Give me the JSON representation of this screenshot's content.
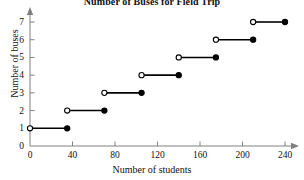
{
  "chart_data": {
    "type": "line",
    "title": "Number of Buses for Field Trip",
    "xlabel": "Number of students",
    "ylabel": "Number of buses",
    "xlim": [
      0,
      240
    ],
    "ylim": [
      0,
      7
    ],
    "xticks": [
      0,
      40,
      80,
      120,
      160,
      200,
      240
    ],
    "yticks": [
      0,
      1,
      2,
      3,
      4,
      5,
      6,
      7
    ],
    "grid": false,
    "legend": false,
    "legend_position": "none",
    "series": [
      {
        "name": "Buses required",
        "marker_open": "open-circle",
        "marker_closed": "filled-circle",
        "steps": [
          {
            "buses": 1,
            "x_start": 0,
            "x_end": 35,
            "start_included": false,
            "end_included": true
          },
          {
            "buses": 2,
            "x_start": 35,
            "x_end": 70,
            "start_included": false,
            "end_included": true
          },
          {
            "buses": 3,
            "x_start": 70,
            "x_end": 105,
            "start_included": false,
            "end_included": true
          },
          {
            "buses": 4,
            "x_start": 105,
            "x_end": 140,
            "start_included": false,
            "end_included": true
          },
          {
            "buses": 5,
            "x_start": 140,
            "x_end": 175,
            "start_included": false,
            "end_included": true
          },
          {
            "buses": 6,
            "x_start": 175,
            "x_end": 210,
            "start_included": false,
            "end_included": true
          },
          {
            "buses": 7,
            "x_start": 210,
            "x_end": 240,
            "start_included": false,
            "end_included": true
          }
        ]
      }
    ],
    "colors": {
      "line": "#000000",
      "axis": "#808080",
      "text": "#111111",
      "background": "#ffffff"
    }
  }
}
